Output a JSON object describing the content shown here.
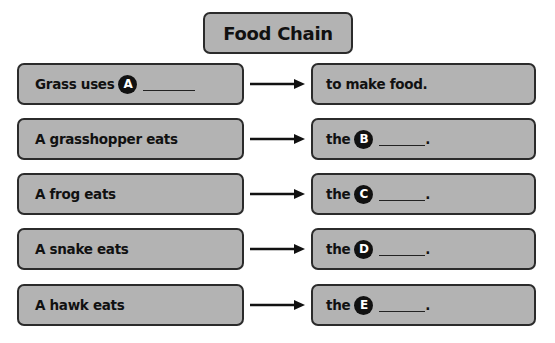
{
  "title": "Food Chain",
  "rows": [
    {
      "left": {
        "text": "Grass uses",
        "badge": "A"
      },
      "right": {
        "text": "to make food."
      }
    },
    {
      "left": {
        "text": "A grasshopper eats"
      },
      "right": {
        "prefix": "the",
        "badge": "B",
        "suffix": "."
      }
    },
    {
      "left": {
        "text": "A frog eats"
      },
      "right": {
        "prefix": "the",
        "badge": "C",
        "suffix": "."
      }
    },
    {
      "left": {
        "text": "A snake eats"
      },
      "right": {
        "prefix": "the",
        "badge": "D",
        "suffix": "."
      }
    },
    {
      "left": {
        "text": "A hawk eats"
      },
      "right": {
        "prefix": "the",
        "badge": "E",
        "suffix": "."
      }
    }
  ],
  "colors": {
    "box_fill": "#b3b3b3",
    "border": "#2b2b2b",
    "badge": "#111111"
  }
}
